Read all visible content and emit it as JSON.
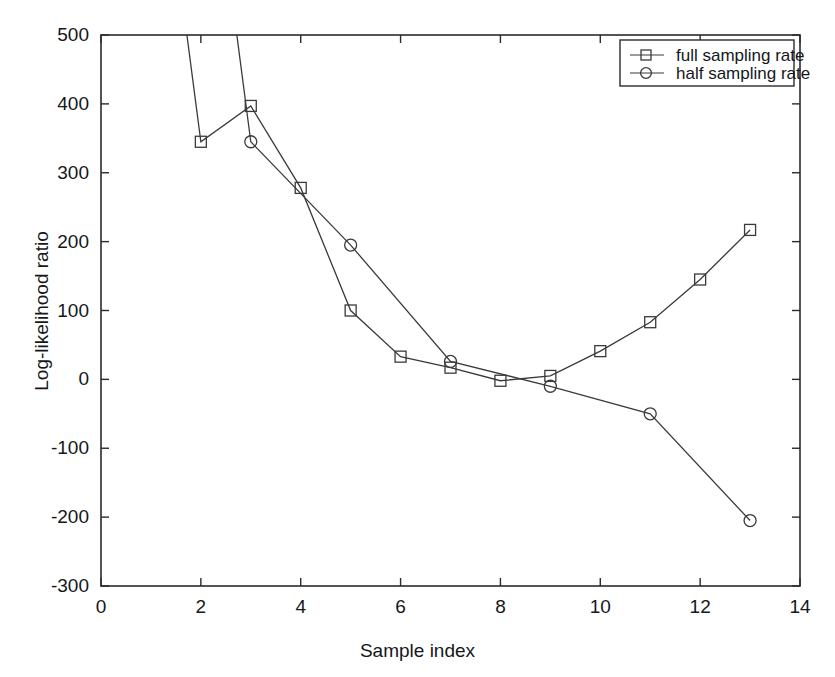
{
  "chart_data": {
    "type": "line",
    "title": "",
    "xlabel": "Sample index",
    "ylabel": "Log-likelihood ratio",
    "xlim": [
      0,
      14
    ],
    "ylim": [
      -300,
      500
    ],
    "xticks": [
      0,
      2,
      4,
      6,
      8,
      10,
      12,
      14
    ],
    "yticks": [
      -300,
      -200,
      -100,
      0,
      100,
      200,
      300,
      400,
      500
    ],
    "xtick_labels": [
      "0",
      "2",
      "4",
      "6",
      "8",
      "10",
      "12",
      "14"
    ],
    "ytick_labels": [
      "-300",
      "-200",
      "-100",
      "0",
      "100",
      "200",
      "300",
      "400",
      "500"
    ],
    "grid": false,
    "legend_position": "top-right",
    "series": [
      {
        "name": "full sampling rate",
        "marker": "square",
        "color": "#3a3a3a",
        "x": [
          1,
          2,
          3,
          4,
          5,
          6,
          7,
          8,
          9,
          10,
          11,
          12,
          13
        ],
        "y": [
          900,
          345,
          397,
          278,
          100,
          33,
          17,
          -2,
          5,
          41,
          83,
          145,
          217
        ],
        "clipped_above_axis": [
          1
        ]
      },
      {
        "name": "half sampling rate",
        "marker": "circle",
        "color": "#3a3a3a",
        "x": [
          2,
          3,
          5,
          7,
          9,
          11,
          13
        ],
        "y": [
          900,
          345,
          195,
          26,
          -10,
          -50,
          -205
        ],
        "clipped_above_axis": [
          2
        ]
      }
    ]
  },
  "legend": {
    "entries": [
      {
        "label": "full sampling rate",
        "marker": "square"
      },
      {
        "label": "half sampling rate",
        "marker": "circle"
      }
    ]
  },
  "axes": {
    "xlabel": "Sample index",
    "ylabel": "Log-likelihood ratio"
  }
}
